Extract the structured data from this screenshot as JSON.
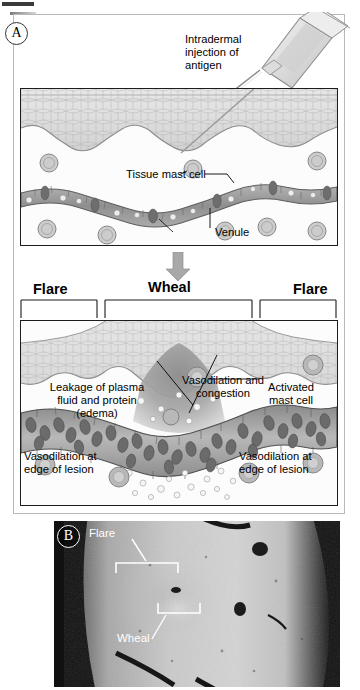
{
  "figure": {
    "panels": [
      {
        "letter": "A",
        "type": "schematic-diagram"
      },
      {
        "letter": "B",
        "type": "clinical-photograph"
      }
    ]
  },
  "panel_a": {
    "letter": "A",
    "top_diagram": {
      "labels": {
        "injection": "Intradermal\ninjection of\nantigen",
        "mast_cell": "Tissue mast cell",
        "venule": "Venule"
      }
    },
    "transition_arrow": "down-arrow",
    "region_headers": {
      "flare_left": "Flare",
      "wheal": "Wheal",
      "flare_right": "Flare"
    },
    "bottom_diagram": {
      "labels": {
        "leakage": "Leakage of plasma\nfluid and protein\n(edema)",
        "vasodilation_congestion": "Vasodilation and\ncongestion",
        "activated_mast_cell": "Activated\nmast cell",
        "vasodilation_edge_left": "Vasodilation at\nedge of lesion",
        "vasodilation_edge_right": "Vasodilation at\nedge of lesion"
      }
    }
  },
  "panel_b": {
    "letter": "B",
    "labels": {
      "flare": "Flare",
      "wheal": "Wheal"
    }
  },
  "colors": {
    "epidermis": "#dcdcdc",
    "epidermis_line": "#9a9a9a",
    "dermis": "#fbfbfb",
    "venule_fill": "#9d9d9d",
    "venule_wall": "#6e6e6e",
    "mast_cell": "#c9c9c9",
    "rbc": "#6b6b6b",
    "wheal_fluid": "#8e8e8e",
    "arrow": "#a8a8a8",
    "frame": "#b9b9b9",
    "box_border": "#1c1c1c",
    "photo_dark": "#121212",
    "photo_skin": "#c8c8c8",
    "label_text": "#000000",
    "photo_label_text": "#ffffff"
  }
}
